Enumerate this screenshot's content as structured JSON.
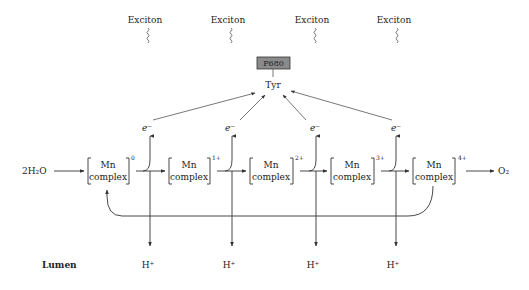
{
  "diagram": {
    "excitons": [
      {
        "label": "Exciton",
        "x": 145
      },
      {
        "label": "Exciton",
        "x": 228
      },
      {
        "label": "Exciton",
        "x": 312
      },
      {
        "label": "Exciton",
        "x": 394
      }
    ],
    "p680": {
      "label": "P680"
    },
    "tyr": {
      "label": "Tyr"
    },
    "reactant": {
      "label": "2H₂O"
    },
    "product": {
      "label": "O₂"
    },
    "complexes": [
      {
        "line1": "Mn",
        "line2": "complex",
        "charge": "0"
      },
      {
        "line1": "Mn",
        "line2": "complex",
        "charge": "1+"
      },
      {
        "line1": "Mn",
        "line2": "complex",
        "charge": "2+"
      },
      {
        "line1": "Mn",
        "line2": "complex",
        "charge": "3+"
      },
      {
        "line1": "Mn",
        "line2": "complex",
        "charge": "4+"
      }
    ],
    "electrons": [
      {
        "label": "e⁻"
      },
      {
        "label": "e⁻"
      },
      {
        "label": "e⁻"
      },
      {
        "label": "e⁻"
      }
    ],
    "protons": [
      {
        "label": "H⁺"
      },
      {
        "label": "H⁺"
      },
      {
        "label": "H⁺"
      },
      {
        "label": "H⁺"
      }
    ],
    "lumen": {
      "label": "Lumen"
    }
  }
}
